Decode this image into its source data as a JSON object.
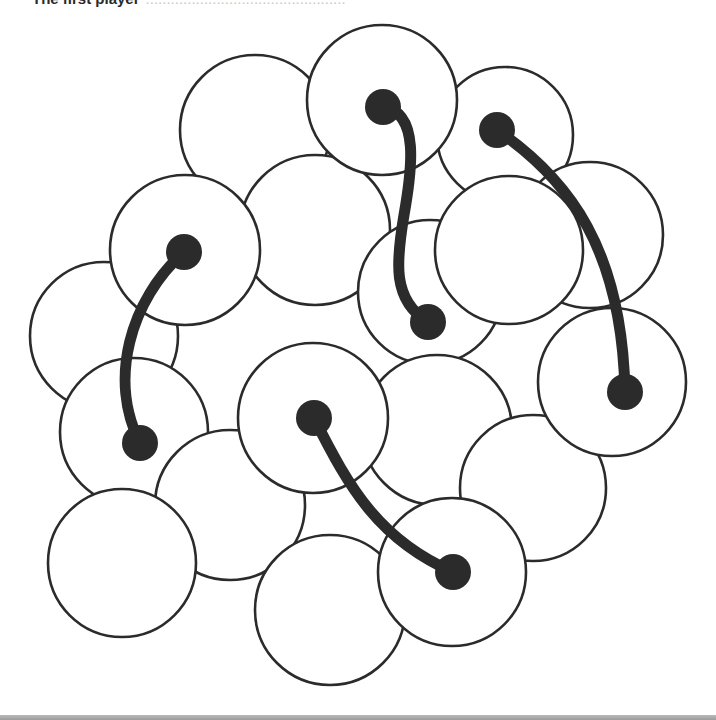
{
  "caption": {
    "lead": "The first player",
    "faded": "................................................"
  },
  "colors": {
    "background": "#ffffff",
    "ink": "#2b2b2b",
    "disc_fill": "#ffffff",
    "footer_bar": "#a8a8a8"
  },
  "board": {
    "width": 716,
    "height": 720,
    "discs": [
      {
        "id": "A",
        "cx": 255,
        "cy": 130,
        "r": 75
      },
      {
        "id": "B",
        "cx": 315,
        "cy": 230,
        "r": 75
      },
      {
        "id": "C",
        "cx": 430,
        "cy": 292,
        "r": 72
      },
      {
        "id": "D",
        "cx": 505,
        "cy": 135,
        "r": 68
      },
      {
        "id": "E",
        "cx": 590,
        "cy": 235,
        "r": 73
      },
      {
        "id": "F",
        "cx": 382,
        "cy": 100,
        "r": 75
      },
      {
        "id": "G",
        "cx": 509,
        "cy": 250,
        "r": 74
      },
      {
        "id": "H",
        "cx": 104,
        "cy": 336,
        "r": 74
      },
      {
        "id": "I",
        "cx": 185,
        "cy": 250,
        "r": 75
      },
      {
        "id": "J",
        "cx": 134,
        "cy": 432,
        "r": 74
      },
      {
        "id": "K",
        "cx": 230,
        "cy": 505,
        "r": 75
      },
      {
        "id": "L",
        "cx": 437,
        "cy": 430,
        "r": 75
      },
      {
        "id": "M",
        "cx": 313,
        "cy": 418,
        "r": 75
      },
      {
        "id": "N",
        "cx": 533,
        "cy": 488,
        "r": 73
      },
      {
        "id": "O",
        "cx": 612,
        "cy": 382,
        "r": 74
      },
      {
        "id": "P",
        "cx": 122,
        "cy": 563,
        "r": 74
      },
      {
        "id": "Q",
        "cx": 330,
        "cy": 610,
        "r": 75
      },
      {
        "id": "R",
        "cx": 452,
        "cy": 572,
        "r": 74
      }
    ],
    "tethers": [
      {
        "id": "T1",
        "from": {
          "x": 383,
          "y": 107
        },
        "to": {
          "x": 428,
          "y": 322
        },
        "path": "M383 107 C 420 112, 412 170, 404 215 C 396 262, 392 300, 428 322"
      },
      {
        "id": "T2",
        "from": {
          "x": 497,
          "y": 130
        },
        "to": {
          "x": 625,
          "y": 392
        },
        "path": "M497 130 C 570 180, 622 250, 625 392"
      },
      {
        "id": "T3",
        "from": {
          "x": 184,
          "y": 252
        },
        "to": {
          "x": 140,
          "y": 443
        },
        "path": "M184 252 C 130 300, 108 380, 140 443"
      },
      {
        "id": "T4",
        "from": {
          "x": 314,
          "y": 418
        },
        "to": {
          "x": 453,
          "y": 572
        },
        "path": "M314 418 C 350 490, 380 540, 453 572"
      }
    ],
    "pin_radius": 18
  }
}
